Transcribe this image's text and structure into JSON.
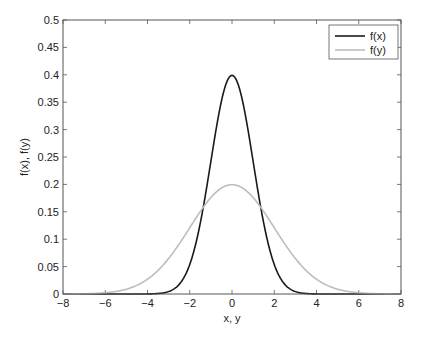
{
  "chart_data": {
    "type": "line",
    "title": "",
    "xlabel": "x, y",
    "ylabel": "f(x), f(y)",
    "xlim": [
      -8,
      8
    ],
    "ylim": [
      0,
      0.5
    ],
    "grid": false,
    "legend_position": "upper right",
    "x_ticks": [
      "−8",
      "−6",
      "−4",
      "−2",
      "0",
      "2",
      "4",
      "6",
      "8"
    ],
    "y_ticks": [
      "0",
      "0.05",
      "0.1",
      "0.15",
      "0.2",
      "0.25",
      "0.3",
      "0.35",
      "0.4",
      "0.45",
      "0.5"
    ],
    "series": [
      {
        "name": "f(x)",
        "color": "#1a1a1a",
        "description": "Normal density, mean 0, sd 1",
        "mean": 0,
        "sd": 1,
        "x": [
          -8,
          -6,
          -4,
          -3,
          -2.5,
          -2,
          -1.5,
          -1,
          -0.5,
          0,
          0.5,
          1,
          1.5,
          2,
          2.5,
          3,
          4,
          6,
          8
        ],
        "y": [
          0,
          0,
          0.0001,
          0.0044,
          0.0175,
          0.054,
          0.1295,
          0.242,
          0.3521,
          0.3989,
          0.3521,
          0.242,
          0.1295,
          0.054,
          0.0175,
          0.0044,
          0.0001,
          0,
          0
        ]
      },
      {
        "name": "f(y)",
        "color": "#bdbdbd",
        "description": "Normal density, mean 0, sd 2",
        "mean": 0,
        "sd": 2,
        "x": [
          -8,
          -6,
          -5,
          -4,
          -3,
          -2,
          -1,
          0,
          1,
          2,
          3,
          4,
          5,
          6,
          8
        ],
        "y": [
          0.0001,
          0.0022,
          0.0088,
          0.027,
          0.0648,
          0.121,
          0.176,
          0.1995,
          0.176,
          0.121,
          0.0648,
          0.027,
          0.0088,
          0.0022,
          0.0001
        ]
      }
    ]
  },
  "legend": {
    "items": [
      {
        "label": "f(x)"
      },
      {
        "label": "f(y)"
      }
    ]
  }
}
